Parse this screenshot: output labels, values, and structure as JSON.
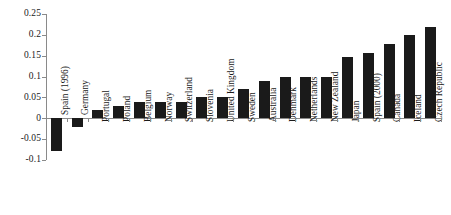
{
  "chart_data": {
    "type": "bar",
    "title": "",
    "subtitle": "",
    "xlabel": "",
    "ylabel": "",
    "ylim": [
      -0.1,
      0.25
    ],
    "ytick_labels": [
      "0.25",
      "0.2",
      "0.15",
      "0.1",
      "0.05",
      "0",
      "-0.05",
      "-0.1"
    ],
    "ytick_values": [
      0.25,
      0.2,
      0.15,
      0.1,
      0.05,
      0,
      -0.05,
      -0.1
    ],
    "grid": false,
    "legend": null,
    "bar_color": "#1a1a1a",
    "axis_color": "#8a8a8a",
    "categories": [
      "Spain (1996)",
      "Germany",
      "Portugal",
      "Poland",
      "Belgium",
      "Norway",
      "Switzerland",
      "Slovenia",
      "United Kingdom",
      "Sweden",
      "Australia",
      "Denmark",
      "Netherlands",
      "New Zealand",
      "Japan",
      "Spain (2000)",
      "Canada",
      "Iceland",
      "Czech Republic"
    ],
    "values": [
      -0.078,
      -0.02,
      0.02,
      0.03,
      0.04,
      0.04,
      0.04,
      0.05,
      0.05,
      0.07,
      0.09,
      0.1,
      0.1,
      0.1,
      0.148,
      0.157,
      0.177,
      0.199,
      0.219
    ]
  }
}
